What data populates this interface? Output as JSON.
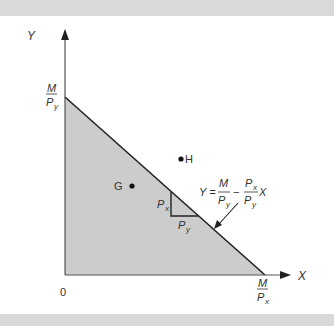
{
  "diagram": {
    "axes": {
      "x_label": "X",
      "y_label": "Y",
      "origin_label": "0"
    },
    "intercepts": {
      "y_intercept": {
        "numerator": "M",
        "denominator": "P",
        "subscript": "y"
      },
      "x_intercept": {
        "numerator": "M",
        "denominator": "P",
        "subscript": "x"
      }
    },
    "points": [
      {
        "label": "G",
        "position": "inside feasible set"
      },
      {
        "label": "H",
        "position": "outside feasible set"
      }
    ],
    "slope_triangle": {
      "vertical_label": "P",
      "vertical_sub": "x",
      "horizontal_label": "P",
      "horizontal_sub": "y"
    },
    "equation": {
      "lhs": "Y =",
      "term1_num": "M",
      "term1_den": "P",
      "term1_den_sub": "y",
      "minus": "−",
      "term2_num": "P",
      "term2_num_sub": "x",
      "term2_den": "P",
      "term2_den_sub": "y",
      "var": "X"
    },
    "colors": {
      "fill": "#cccccc",
      "line": "#222222",
      "band": "#d9d9d9"
    }
  }
}
